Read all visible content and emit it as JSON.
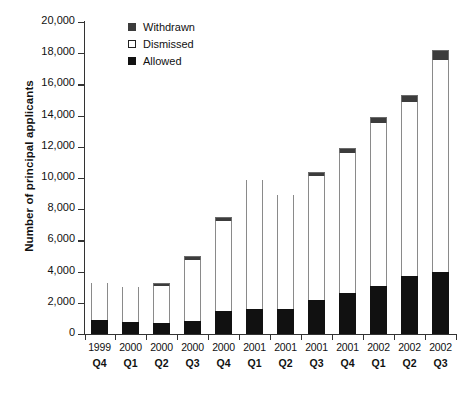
{
  "chart_data": {
    "type": "bar",
    "stacked": true,
    "title": "",
    "xlabel": "",
    "ylabel": "Number of principal applicants",
    "ylim": [
      0,
      20000
    ],
    "ytick_step": 2000,
    "grid": false,
    "legend_position": "top-left-inside",
    "categories": [
      {
        "year": "1999",
        "quarter": "Q4"
      },
      {
        "year": "2000",
        "quarter": "Q1"
      },
      {
        "year": "2000",
        "quarter": "Q2"
      },
      {
        "year": "2000",
        "quarter": "Q3"
      },
      {
        "year": "2000",
        "quarter": "Q4"
      },
      {
        "year": "2001",
        "quarter": "Q1"
      },
      {
        "year": "2001",
        "quarter": "Q2"
      },
      {
        "year": "2001",
        "quarter": "Q3"
      },
      {
        "year": "2001",
        "quarter": "Q4"
      },
      {
        "year": "2002",
        "quarter": "Q1"
      },
      {
        "year": "2002",
        "quarter": "Q2"
      },
      {
        "year": "2002",
        "quarter": "Q3"
      }
    ],
    "ytick_labels": [
      "20,000",
      "18,000",
      "16,000",
      "14,000",
      "12,000",
      "10,000",
      "8,000",
      "6,000",
      "4,000",
      "2,000",
      "0"
    ],
    "ytick_values": [
      20000,
      18000,
      16000,
      14000,
      12000,
      10000,
      8000,
      6000,
      4000,
      2000,
      0
    ],
    "series": [
      {
        "name": "Allowed",
        "color": "#111111",
        "values": [
          900,
          750,
          700,
          850,
          1450,
          1600,
          1600,
          2200,
          2650,
          3100,
          3700,
          3950
        ]
      },
      {
        "name": "Dismissed",
        "color": "#ffffff",
        "values": [
          2400,
          2250,
          2350,
          3900,
          5800,
          8250,
          7300,
          7900,
          8950,
          10450,
          11150,
          13600
        ]
      },
      {
        "name": "Withdrawn",
        "color": "#3c3c3c",
        "values": [
          0,
          0,
          200,
          250,
          250,
          0,
          0,
          300,
          350,
          350,
          500,
          650
        ]
      }
    ],
    "totals": [
      3300,
      3000,
      3250,
      5000,
      7500,
      9850,
      8900,
      10400,
      11950,
      13900,
      15350,
      18200
    ]
  },
  "legend": {
    "items": [
      {
        "label": "Withdrawn",
        "swatch": "withdrawn"
      },
      {
        "label": "Dismissed",
        "swatch": "dismissed"
      },
      {
        "label": "Allowed",
        "swatch": "allowed"
      }
    ]
  }
}
